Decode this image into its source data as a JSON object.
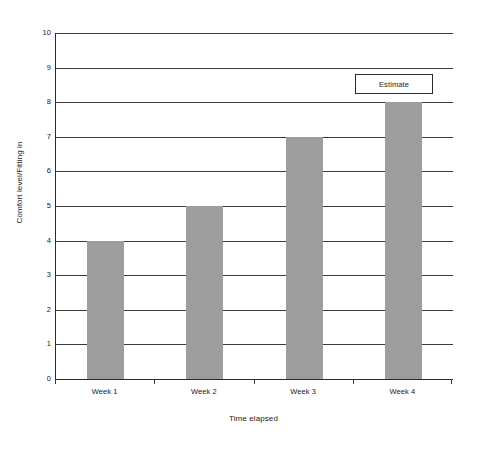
{
  "chart_data": {
    "type": "bar",
    "title": "",
    "categories": [
      "Week 1",
      "Week 2",
      "Week 3",
      "Week 4"
    ],
    "values": [
      4,
      5,
      7,
      8
    ],
    "series": [
      {
        "name": "Estimate",
        "values": [
          4,
          5,
          7,
          8
        ]
      }
    ],
    "xlabel": "Time elapsed",
    "ylabel": "Comfort level/Fitting in",
    "ylim": [
      0,
      10
    ],
    "ytick_labels": [
      "10",
      "9",
      "8",
      "7",
      "6",
      "5",
      "4",
      "3",
      "2",
      "1",
      "0"
    ],
    "ytick_values": [
      10,
      9,
      8,
      7,
      6,
      5,
      4,
      3,
      2,
      1,
      0
    ],
    "grid": "horizontal",
    "legend_position": "top-right",
    "legend_entries": [
      "Estimate"
    ],
    "bar_color": "#9d9d9d",
    "axis_color": "#2b2b2b",
    "grid_color": "#3a3a3a",
    "background_color": "#ffffff"
  },
  "legend": {
    "label": "Estimate"
  },
  "axes": {
    "y_title": "Comfort level/Fitting in",
    "x_title": "Time elapsed"
  }
}
